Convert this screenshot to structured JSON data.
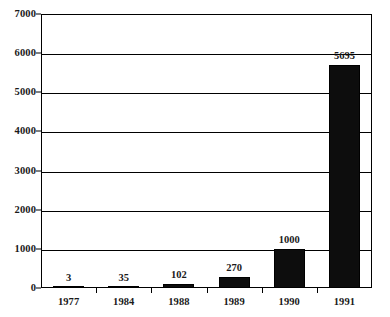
{
  "chart_data": {
    "type": "bar",
    "title": "",
    "subtitle": "",
    "xlabel": "",
    "ylabel": "",
    "categories": [
      "1977",
      "1984",
      "1988",
      "1989",
      "1990",
      "1991"
    ],
    "values": [
      3,
      35,
      102,
      270,
      1000,
      5695
    ],
    "value_labels": [
      "3",
      "35",
      "102",
      "270",
      "1000",
      "5695"
    ],
    "ylim": [
      0,
      7000
    ],
    "ytick_labels": [
      "7000",
      "6000",
      "5000",
      "4000",
      "3000",
      "2000",
      "1000",
      "0"
    ],
    "ytick_values": [
      7000,
      6000,
      5000,
      4000,
      3000,
      2000,
      1000,
      0
    ],
    "grid": "horizontal",
    "legend": "none",
    "bar_color": "#0d0d0d",
    "axis_color": "#000000",
    "background_color": "#ffffff"
  }
}
